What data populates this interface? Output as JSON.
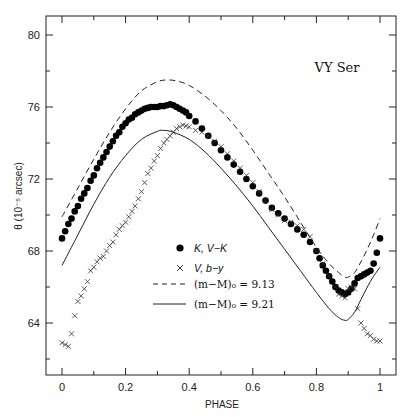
{
  "chart_data": {
    "type": "scatter",
    "title": "",
    "annotation": "VY Ser",
    "xlabel": "PHASE",
    "ylabel": "θ (10⁻⁵ arcsec)",
    "xlim": [
      -0.05,
      1.05
    ],
    "ylim": [
      61.1,
      81.05
    ],
    "xticks": [
      0,
      0.2,
      0.4,
      0.6,
      0.8,
      1
    ],
    "xtick_labels": [
      "0",
      "0.2",
      "0.4",
      "0.6",
      "0.8",
      "1"
    ],
    "yticks": [
      64,
      68,
      72,
      76,
      80
    ],
    "ytick_labels": [
      "64",
      "68",
      "72",
      "76",
      "80"
    ],
    "grid": false,
    "legend_position": "lower-center",
    "legend": [
      {
        "marker": "filled-circle",
        "label_italic": "K, V−K",
        "label": ""
      },
      {
        "marker": "cross",
        "label_italic": "V, b−y",
        "label": ""
      },
      {
        "marker": "dashed-line",
        "label": "(m−M)₀ = 9.13"
      },
      {
        "marker": "solid-line",
        "label": "(m−M)₀ = 9.21"
      }
    ],
    "series": [
      {
        "name": "K, V−K",
        "style": "filled-circle",
        "x": [
          0,
          0.01,
          0.02,
          0.03,
          0.04,
          0.05,
          0.06,
          0.07,
          0.08,
          0.09,
          0.1,
          0.11,
          0.12,
          0.13,
          0.14,
          0.15,
          0.16,
          0.17,
          0.18,
          0.19,
          0.2,
          0.21,
          0.22,
          0.23,
          0.24,
          0.25,
          0.26,
          0.27,
          0.28,
          0.29,
          0.3,
          0.31,
          0.32,
          0.33,
          0.34,
          0.35,
          0.36,
          0.37,
          0.38,
          0.39,
          0.4,
          0.42,
          0.44,
          0.46,
          0.48,
          0.5,
          0.52,
          0.54,
          0.56,
          0.58,
          0.6,
          0.62,
          0.64,
          0.66,
          0.68,
          0.7,
          0.72,
          0.74,
          0.76,
          0.78,
          0.8,
          0.81,
          0.82,
          0.83,
          0.84,
          0.85,
          0.86,
          0.87,
          0.88,
          0.89,
          0.9,
          0.91,
          0.92,
          0.93,
          0.94,
          0.95,
          0.96,
          0.97,
          0.98,
          0.99,
          1.0
        ],
        "y": [
          68.7,
          69.1,
          69.5,
          69.8,
          70.2,
          70.5,
          70.9,
          71.2,
          71.5,
          71.9,
          72.2,
          72.6,
          72.9,
          73.2,
          73.5,
          73.8,
          74.1,
          74.4,
          74.6,
          74.9,
          75.1,
          75.3,
          75.4,
          75.6,
          75.7,
          75.8,
          75.9,
          75.95,
          76.0,
          76.0,
          76.0,
          76.05,
          76.05,
          76.1,
          76.15,
          76.1,
          76.0,
          75.9,
          75.8,
          75.7,
          75.5,
          75.2,
          74.8,
          74.4,
          74.0,
          73.6,
          73.2,
          72.8,
          72.4,
          72.0,
          71.6,
          71.2,
          70.8,
          70.4,
          70.1,
          69.8,
          69.5,
          69.2,
          68.9,
          68.5,
          68.0,
          67.6,
          67.2,
          66.9,
          66.6,
          66.3,
          66.0,
          65.8,
          65.7,
          65.6,
          65.7,
          65.9,
          66.2,
          66.5,
          66.6,
          66.7,
          66.8,
          66.9,
          67.3,
          67.9,
          68.7
        ]
      },
      {
        "name": "V, b−y",
        "style": "cross",
        "x": [
          0,
          0.01,
          0.02,
          0.03,
          0.04,
          0.05,
          0.06,
          0.07,
          0.08,
          0.09,
          0.1,
          0.11,
          0.12,
          0.13,
          0.14,
          0.15,
          0.16,
          0.17,
          0.18,
          0.19,
          0.2,
          0.21,
          0.22,
          0.23,
          0.24,
          0.25,
          0.26,
          0.27,
          0.28,
          0.29,
          0.3,
          0.31,
          0.32,
          0.33,
          0.34,
          0.35,
          0.36,
          0.37,
          0.38,
          0.39,
          0.4,
          0.42,
          0.44,
          0.46,
          0.48,
          0.5,
          0.52,
          0.54,
          0.56,
          0.58,
          0.6,
          0.62,
          0.64,
          0.66,
          0.68,
          0.7,
          0.72,
          0.74,
          0.76,
          0.78,
          0.8,
          0.82,
          0.84,
          0.86,
          0.87,
          0.88,
          0.89,
          0.9,
          0.91,
          0.92,
          0.93,
          0.94,
          0.95,
          0.96,
          0.97,
          0.98,
          0.99,
          1.0
        ],
        "y": [
          62.9,
          62.8,
          62.7,
          63.4,
          64.4,
          65.2,
          65.5,
          65.9,
          66.3,
          66.9,
          67.1,
          67.4,
          67.6,
          67.7,
          68.0,
          68.3,
          68.5,
          68.9,
          69.2,
          69.4,
          69.6,
          69.9,
          70.2,
          70.5,
          70.9,
          71.3,
          71.8,
          72.3,
          72.6,
          73.0,
          73.3,
          73.7,
          74.0,
          74.2,
          74.4,
          74.6,
          74.8,
          74.9,
          75.0,
          74.95,
          74.9,
          74.7,
          74.6,
          74.4,
          74.1,
          73.8,
          73.4,
          73.0,
          72.6,
          72.2,
          71.8,
          71.3,
          70.8,
          70.3,
          70.0,
          69.7,
          69.6,
          69.4,
          69.2,
          68.8,
          68.0,
          67.3,
          66.6,
          66.0,
          65.6,
          65.5,
          65.4,
          65.9,
          66.0,
          65.9,
          64.8,
          64.0,
          63.7,
          63.4,
          63.3,
          63.1,
          63.0,
          63.0
        ]
      },
      {
        "name": "(m−M)₀ = 9.13",
        "style": "dashed-line",
        "x": [
          0,
          0.05,
          0.1,
          0.15,
          0.2,
          0.25,
          0.3,
          0.33,
          0.36,
          0.4,
          0.45,
          0.5,
          0.55,
          0.6,
          0.65,
          0.7,
          0.75,
          0.8,
          0.84,
          0.87,
          0.89,
          0.9,
          0.92,
          0.94,
          0.96,
          0.98,
          1.0
        ],
        "y": [
          69.9,
          71.5,
          73.1,
          74.6,
          75.9,
          76.9,
          77.4,
          77.5,
          77.45,
          77.2,
          76.6,
          75.8,
          74.8,
          73.6,
          72.3,
          71.0,
          69.6,
          68.2,
          67.3,
          66.8,
          66.55,
          66.55,
          66.8,
          67.4,
          68.1,
          68.9,
          69.8
        ]
      },
      {
        "name": "(m−M)₀ = 9.21",
        "style": "solid-line",
        "x": [
          0,
          0.05,
          0.1,
          0.15,
          0.2,
          0.25,
          0.3,
          0.32,
          0.35,
          0.4,
          0.45,
          0.5,
          0.55,
          0.6,
          0.65,
          0.7,
          0.75,
          0.8,
          0.84,
          0.87,
          0.89,
          0.9,
          0.92,
          0.94,
          0.96,
          0.98,
          1.0
        ],
        "y": [
          67.2,
          68.9,
          70.6,
          72.1,
          73.3,
          74.2,
          74.65,
          74.7,
          74.6,
          74.2,
          73.5,
          72.6,
          71.6,
          70.5,
          69.3,
          68.1,
          66.9,
          65.7,
          64.8,
          64.3,
          64.15,
          64.2,
          64.6,
          65.3,
          66.0,
          66.6,
          67.1
        ]
      }
    ]
  }
}
